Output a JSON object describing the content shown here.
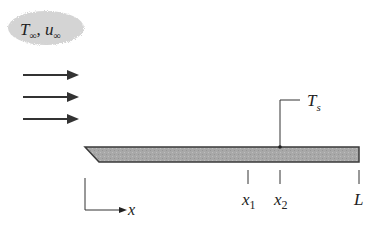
{
  "diagram": {
    "freestream_label": {
      "T": "T",
      "T_sub": "∞",
      "sep": ", ",
      "u": "u",
      "u_sub": "∞"
    },
    "surface_temp_label": {
      "T": "T",
      "sub": "s"
    },
    "axis_label": "x",
    "positions": [
      {
        "name": "x1",
        "main": "x",
        "sub": "1"
      },
      {
        "name": "x2",
        "main": "x",
        "sub": "2"
      },
      {
        "name": "L",
        "main": "L",
        "sub": ""
      }
    ],
    "flow_arrows": 3,
    "colors": {
      "plate_fill": "#a9a9a9",
      "plate_stroke": "#3a3a3a",
      "cloud_fill": "#d6d6d6",
      "line": "#333333"
    }
  }
}
